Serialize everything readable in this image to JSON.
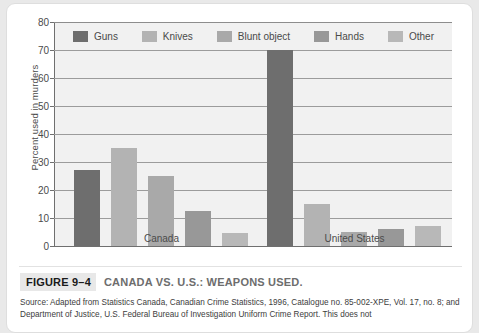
{
  "figure": {
    "badge": "FIGURE 9–4",
    "title": "CANADA VS. U.S.: WEAPONS USED.",
    "source": "Source: Adapted from Statistics Canada, Canadian Crime Statistics, 1996, Catalogue no. 85-002-XPE, Vol. 17, no. 8; and Department of Justice, U.S. Federal Bureau of Investigation Uniform Crime Report. This does not"
  },
  "colors": {
    "guns": "#6e6e6e",
    "knives": "#b3b3b3",
    "blunt_object": "#a9a9a9",
    "hands": "#989898",
    "other": "#b8b8b8",
    "plot_background": "#f1f1f1",
    "gridline": "#9c9c9c",
    "axis": "#6f6f6f",
    "text": "#4b4b4b"
  },
  "chart_data": {
    "type": "bar",
    "title": "CANADA VS. U.S.: WEAPONS USED.",
    "xlabel": "",
    "ylabel": "Percent used in murders",
    "categories": [
      "Canada",
      "United States"
    ],
    "series": [
      {
        "name": "Guns",
        "values": [
          27,
          70
        ]
      },
      {
        "name": "Knives",
        "values": [
          35,
          15
        ]
      },
      {
        "name": "Blunt object",
        "values": [
          25,
          5
        ]
      },
      {
        "name": "Hands",
        "values": [
          12.5,
          6
        ]
      },
      {
        "name": "Other",
        "values": [
          4.5,
          7
        ]
      }
    ],
    "ylim": [
      0,
      80
    ],
    "yticks": [
      0,
      10,
      20,
      30,
      40,
      50,
      60,
      70,
      80
    ],
    "ytick_labels": [
      "0",
      "10",
      "20",
      "30",
      "40",
      "50",
      "60",
      "70",
      "80"
    ],
    "grid": true,
    "legend_position": "top-inside"
  }
}
